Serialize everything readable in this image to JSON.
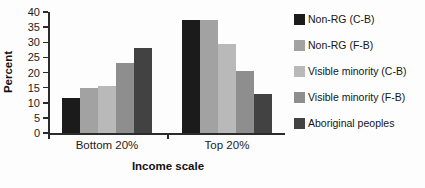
{
  "chart_data": {
    "type": "bar",
    "title": "",
    "xlabel": "Income scale",
    "ylabel": "Percent",
    "categories": [
      "Bottom 20%",
      "Top 20%"
    ],
    "series": [
      {
        "name": "Non-RG (C-B)",
        "color": "#1b1b1b",
        "values": [
          11.5,
          37.5
        ]
      },
      {
        "name": "Non-RG (F-B)",
        "color": "#a2a2a2",
        "values": [
          15,
          37.5
        ]
      },
      {
        "name": "Visible minority (C-B)",
        "color": "#b9b9b9",
        "values": [
          15.5,
          29.5
        ]
      },
      {
        "name": "Visible minority (F-B)",
        "color": "#8e8e8e",
        "values": [
          23,
          20.5
        ]
      },
      {
        "name": "Aboriginal peoples",
        "color": "#424242",
        "values": [
          28,
          13
        ]
      }
    ],
    "ylim": [
      0,
      40
    ],
    "ytick_step": 5,
    "yticks": [
      0,
      5,
      10,
      15,
      20,
      25,
      30,
      35,
      40
    ],
    "grid": false,
    "legend_position": "right",
    "axis_color": "#2b2b2b"
  }
}
